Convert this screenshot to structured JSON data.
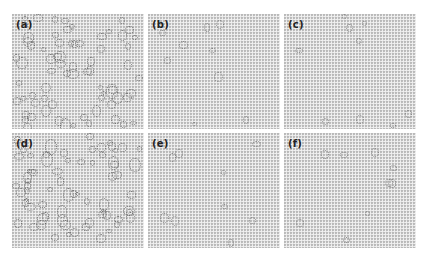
{
  "figure": {
    "panels": [
      {
        "id": "a",
        "label": "(a)",
        "density": "high",
        "left": 12,
        "top": 14
      },
      {
        "id": "b",
        "label": "(b)",
        "density": "low",
        "left": 148,
        "top": 14
      },
      {
        "id": "c",
        "label": "(c)",
        "density": "low",
        "left": 284,
        "top": 14
      },
      {
        "id": "d",
        "label": "(d)",
        "density": "high",
        "left": 12,
        "top": 133
      },
      {
        "id": "e",
        "label": "(e)",
        "density": "low",
        "left": 148,
        "top": 133
      },
      {
        "id": "f",
        "label": "(f)",
        "density": "low",
        "left": 284,
        "top": 133
      }
    ]
  }
}
